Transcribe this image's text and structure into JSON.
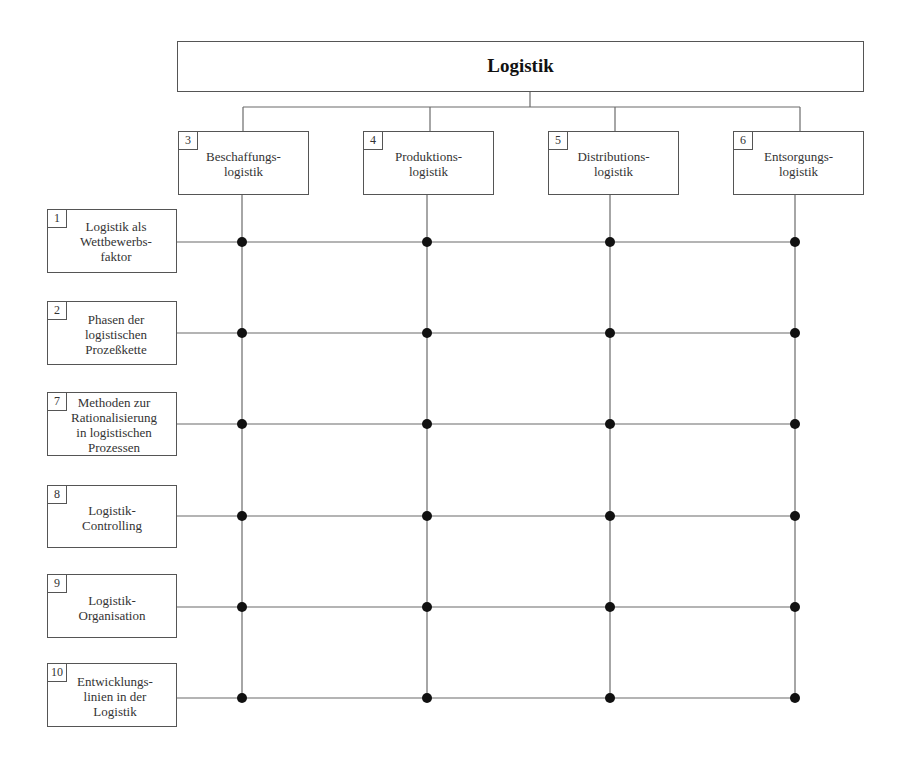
{
  "title": "Logistik",
  "colors": {
    "line": "#6b6b6b",
    "node": "#111111",
    "border": "#555555",
    "text": "#333333"
  },
  "columns": [
    {
      "num": "3",
      "label": "Beschaffungs-\nlogistik",
      "x": 242
    },
    {
      "num": "4",
      "label": "Produktions-\nlogistik",
      "x": 427
    },
    {
      "num": "5",
      "label": "Distributions-\nlogistik",
      "x": 610
    },
    {
      "num": "6",
      "label": "Entsorgungs-\nlogistik",
      "x": 795
    }
  ],
  "rows": [
    {
      "num": "1",
      "label": "Logistik als\nWettbewerbs-\nfaktor",
      "y": 242
    },
    {
      "num": "2",
      "label": "Phasen der\nlogistischen\nProzeßkette",
      "y": 333
    },
    {
      "num": "7",
      "label": "Methoden zur\nRationalisierung\nin logistischen\nProzessen",
      "y": 424
    },
    {
      "num": "8",
      "label": "Logistik-\nControlling",
      "y": 516
    },
    {
      "num": "9",
      "label": "Logistik-\nOrganisation",
      "y": 607
    },
    {
      "num": "10",
      "label": "Entwicklungs-\nlinien in der\nLogistik",
      "y": 698
    }
  ]
}
